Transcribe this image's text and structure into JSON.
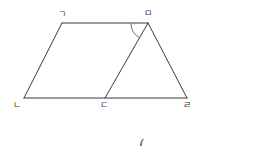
{
  "figure": {
    "type": "geometry-diagram",
    "shape": "trapezoid-with-internal-segment",
    "background_color": "#ffffff",
    "stroke_color": "#3a3a3a",
    "stroke_width": 1,
    "vertices": [
      {
        "label": "ㄱ",
        "name": "vertex-g",
        "x": 62,
        "y": 23,
        "label_x": 58,
        "label_y": 10
      },
      {
        "label": "ㅁ",
        "name": "vertex-m",
        "x": 148,
        "y": 23,
        "label_x": 144,
        "label_y": 9
      },
      {
        "label": "ㄴ",
        "name": "vertex-n",
        "x": 24,
        "y": 98,
        "label_x": 13,
        "label_y": 101
      },
      {
        "label": "ㄷ",
        "name": "vertex-d",
        "x": 105,
        "y": 98,
        "label_x": 100,
        "label_y": 101
      },
      {
        "label": "ㄹ",
        "name": "vertex-r",
        "x": 187,
        "y": 98,
        "label_x": 183,
        "label_y": 101
      }
    ],
    "edges": [
      {
        "name": "edge-g-m",
        "from": "ㄱ",
        "to": "ㅁ"
      },
      {
        "name": "edge-g-n",
        "from": "ㄱ",
        "to": "ㄴ"
      },
      {
        "name": "edge-n-r",
        "from": "ㄴ",
        "to": "ㄹ"
      },
      {
        "name": "edge-m-r",
        "from": "ㅁ",
        "to": "ㄹ"
      },
      {
        "name": "edge-m-d",
        "from": "ㅁ",
        "to": "ㄷ"
      }
    ],
    "angle_marks": [
      {
        "name": "angle-arc-at-m",
        "at_vertex": "ㅁ",
        "between": [
          "edge-g-m",
          "edge-m-d"
        ],
        "radius": 17
      }
    ]
  },
  "answer": {
    "open_paren": "(",
    "close_paren": ")",
    "value": ""
  }
}
